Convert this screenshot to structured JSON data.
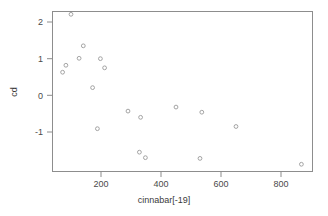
{
  "chart_data": {
    "type": "scatter",
    "title": "",
    "xlabel": "cinnabar[-19]",
    "ylabel": "cd",
    "xlim": [
      41,
      894
    ],
    "ylim": [
      -1.95,
      2.44
    ],
    "xticks": [
      200,
      400,
      600,
      800
    ],
    "xtick_labels": [
      "200",
      "400",
      "600",
      "800"
    ],
    "yticks": [
      2,
      1,
      0,
      -1
    ],
    "ytick_labels": [
      "2",
      "1",
      "0",
      "-1"
    ],
    "grid": false,
    "legend": null,
    "marker": "open-circle",
    "marker_color": "#9a9a9a",
    "points": [
      {
        "x": 72,
        "y": 0.63
      },
      {
        "x": 83,
        "y": 0.82
      },
      {
        "x": 100,
        "y": 2.21
      },
      {
        "x": 127,
        "y": 1.01
      },
      {
        "x": 141,
        "y": 1.35
      },
      {
        "x": 172,
        "y": 0.21
      },
      {
        "x": 188,
        "y": -0.91
      },
      {
        "x": 198,
        "y": 1.0
      },
      {
        "x": 212,
        "y": 0.75
      },
      {
        "x": 290,
        "y": -0.43
      },
      {
        "x": 328,
        "y": -1.55
      },
      {
        "x": 332,
        "y": -0.6
      },
      {
        "x": 348,
        "y": -1.7
      },
      {
        "x": 450,
        "y": -0.32
      },
      {
        "x": 530,
        "y": -1.72
      },
      {
        "x": 536,
        "y": -0.46
      },
      {
        "x": 650,
        "y": -0.85
      },
      {
        "x": 868,
        "y": -1.88
      }
    ]
  },
  "axis": {
    "xtitle": "cinnabar[-19]",
    "ytitle": "cd"
  }
}
